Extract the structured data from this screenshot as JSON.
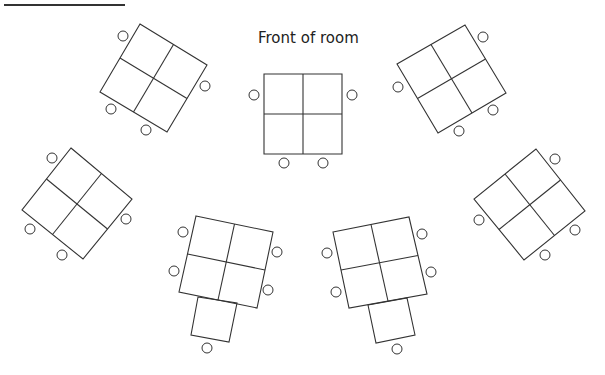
{
  "diagram": {
    "title": "Front of room",
    "line_color": "#333333",
    "header_rule": {
      "x1": 4,
      "y1": 5,
      "x2": 125,
      "y2": 5
    },
    "groups": [
      {
        "name": "top-left-table",
        "corners": [
          [
            140,
            24
          ],
          [
            207,
            65
          ],
          [
            167,
            132
          ],
          [
            100,
            92
          ]
        ],
        "seats": [
          [
            123,
            36
          ],
          [
            205,
            86
          ],
          [
            111,
            109
          ],
          [
            146,
            130
          ]
        ],
        "extra_desk": null
      },
      {
        "name": "center-front-table",
        "corners": [
          [
            264,
            74
          ],
          [
            342,
            74
          ],
          [
            342,
            154
          ],
          [
            264,
            154
          ]
        ],
        "seats": [
          [
            254,
            95
          ],
          [
            352,
            95
          ],
          [
            284,
            163
          ],
          [
            323,
            163
          ]
        ],
        "extra_desk": null
      },
      {
        "name": "top-right-table",
        "corners": [
          [
            465,
            25
          ],
          [
            506,
            93
          ],
          [
            438,
            133
          ],
          [
            397,
            64
          ]
        ],
        "seats": [
          [
            483,
            37
          ],
          [
            398,
            87
          ],
          [
            493,
            110
          ],
          [
            459,
            131
          ]
        ],
        "extra_desk": null
      },
      {
        "name": "middle-left-table",
        "corners": [
          [
            71,
            148
          ],
          [
            132,
            199
          ],
          [
            83,
            259
          ],
          [
            22,
            210
          ]
        ],
        "seats": [
          [
            52,
            158
          ],
          [
            126,
            219
          ],
          [
            30,
            229
          ],
          [
            62,
            255
          ]
        ],
        "extra_desk": null
      },
      {
        "name": "middle-right-table",
        "corners": [
          [
            536,
            149
          ],
          [
            585,
            211
          ],
          [
            524,
            260
          ],
          [
            474,
            199
          ]
        ],
        "seats": [
          [
            555,
            159
          ],
          [
            479,
            220
          ],
          [
            575,
            230
          ],
          [
            545,
            255
          ]
        ],
        "extra_desk": null
      },
      {
        "name": "bottom-left-table",
        "corners": [
          [
            196,
            216
          ],
          [
            273,
            232
          ],
          [
            257,
            308
          ],
          [
            179,
            292
          ]
        ],
        "seats": [
          [
            183,
            232
          ],
          [
            174,
            271
          ],
          [
            277,
            252
          ],
          [
            268,
            290
          ],
          [
            207,
            348
          ]
        ],
        "extra_desk": [
          [
            198,
            297
          ],
          [
            237,
            303
          ],
          [
            229,
            342
          ],
          [
            191,
            335
          ]
        ]
      },
      {
        "name": "bottom-right-table",
        "corners": [
          [
            333,
            232
          ],
          [
            409,
            217
          ],
          [
            427,
            294
          ],
          [
            349,
            308
          ]
        ],
        "seats": [
          [
            327,
            253
          ],
          [
            336,
            292
          ],
          [
            422,
            234
          ],
          [
            431,
            272
          ],
          [
            397,
            349
          ]
        ],
        "extra_desk": [
          [
            368,
            305
          ],
          [
            407,
            298
          ],
          [
            415,
            335
          ],
          [
            376,
            343
          ]
        ]
      }
    ],
    "seat_radius": 5
  }
}
